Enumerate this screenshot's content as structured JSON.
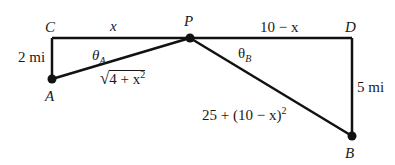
{
  "diagram": {
    "colors": {
      "line": "#111111",
      "text": "#1a1a1a",
      "background": "#ffffff"
    },
    "points": {
      "C": {
        "label": "C",
        "x": 52,
        "y": 38
      },
      "P": {
        "label": "P",
        "x": 190,
        "y": 38
      },
      "D": {
        "label": "D",
        "x": 352,
        "y": 38
      },
      "A": {
        "label": "A",
        "x": 52,
        "y": 79
      },
      "B": {
        "label": "B",
        "x": 352,
        "y": 136
      }
    },
    "segments": {
      "CP": {
        "label": "x"
      },
      "PD": {
        "label": "10 − x"
      },
      "CA": {
        "label": "2 mi"
      },
      "DB": {
        "label": "5 mi"
      },
      "AP": {
        "radicand_base": "4 + x",
        "exponent": "2"
      },
      "PB": {
        "base": "25 + (10 − x)",
        "exponent": "2"
      }
    },
    "angles": {
      "theta_A": {
        "symbol": "θ",
        "subscript": "A"
      },
      "theta_B": {
        "symbol": "θ",
        "subscript": "B"
      }
    }
  }
}
